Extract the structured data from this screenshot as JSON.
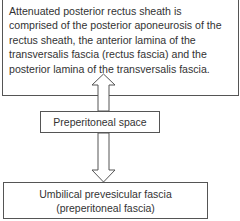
{
  "diagram": {
    "top_box": {
      "text": "Attenuated posterior rectus sheath is comprised of the posterior aponeurosis of the rectus sheath, the anterior lamina of the transversalis fascia (rectus fascia) and the posterior lamina of the transversalis fascia."
    },
    "middle_box": {
      "text": "Preperitoneal space"
    },
    "bottom_box": {
      "line1": "Umbilical prevesicular fascia",
      "line2": "(preperitoneal fascia)"
    },
    "arrows": [
      {
        "from": "middle_box",
        "to": "top_box",
        "direction": "up",
        "style": "hollow"
      },
      {
        "from": "middle_box",
        "to": "bottom_box",
        "direction": "down",
        "style": "hollow"
      }
    ],
    "colors": {
      "stroke": "#555555",
      "text": "#333333",
      "background": "#ffffff"
    }
  }
}
